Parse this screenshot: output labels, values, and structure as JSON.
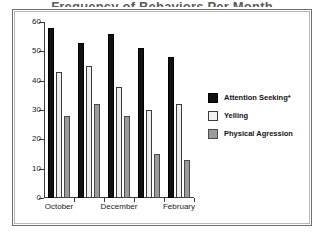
{
  "figure": {
    "title_remnant": "Frequency of Behaviors Per Month",
    "frame_color": "#6e6e6e"
  },
  "chart_data": {
    "type": "bar",
    "title": "",
    "xlabel": "",
    "ylabel": "",
    "ylim": [
      0,
      60
    ],
    "yticks": [
      0,
      10,
      20,
      30,
      40,
      50,
      60
    ],
    "ytick_labels": [
      "0",
      "10",
      "20",
      "30",
      "40",
      "50",
      "60"
    ],
    "grid": false,
    "legend_position": "right",
    "categories": [
      "October",
      "",
      "December",
      "",
      "February"
    ],
    "xtick_labels": [
      "October",
      "December",
      "February"
    ],
    "series": [
      {
        "name": "Attention Seeking*",
        "color": "#111111",
        "values": [
          58,
          53,
          56,
          51,
          48
        ]
      },
      {
        "name": "Yelling",
        "color": "#efefef",
        "values": [
          43,
          45,
          38,
          30,
          32
        ]
      },
      {
        "name": "Physical Agression",
        "color": "#9b9b9b",
        "values": [
          28,
          32,
          28,
          15,
          13
        ]
      }
    ]
  }
}
